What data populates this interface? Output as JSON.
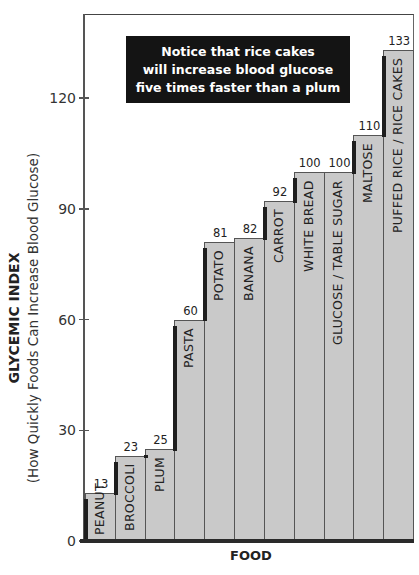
{
  "chart_data": {
    "type": "bar",
    "title": "",
    "annotation": "Notice that rice cakes will increase blood glucose five times faster than a plum",
    "annotation_lines": [
      "Notice that rice cakes",
      "will increase blood glucose",
      "five times faster than a plum"
    ],
    "xlabel": "FOOD",
    "ylabel": "GLYCEMIC INDEX",
    "ylabel_sub": "(How Quickly Foods Can Increase Blood Glucose)",
    "categories": [
      "PEANUT",
      "BROCCOLI",
      "PLUM",
      "PASTA",
      "POTATO",
      "BANANA",
      "CARROT",
      "WHITE BREAD",
      "GLUCOSE / TABLE SUGAR",
      "MALTOSE",
      "PUFFED RICE / RICE CAKES"
    ],
    "values": [
      13,
      23,
      25,
      60,
      81,
      82,
      92,
      100,
      100,
      110,
      133
    ],
    "value_labels": [
      "13",
      "23",
      "25",
      "60",
      "81",
      "82",
      "92",
      "100",
      "100",
      "110",
      "133"
    ],
    "yticks": [
      0,
      30,
      60,
      90,
      120
    ],
    "ytick_labels": [
      "0",
      "30",
      "60",
      "90",
      "120"
    ],
    "ylim": [
      0,
      135
    ],
    "grid": false,
    "legend": null,
    "bar_color": "#c9c9c9",
    "shadow_color": "#1e1e1e",
    "annotation_bg": "#141414"
  }
}
